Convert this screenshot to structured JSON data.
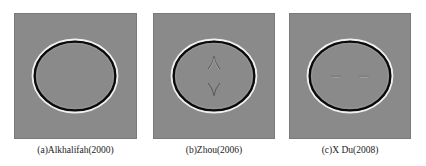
{
  "figure": {
    "panels": [
      {
        "id": "a",
        "caption": "(a)Alkhalifah(2000)",
        "artifact": "none"
      },
      {
        "id": "b",
        "caption": "(b)Zhou(2006)",
        "artifact": "diamond-shaped cusp artifacts (top and bottom) inside wavefront"
      },
      {
        "id": "c",
        "caption": "(c)X Du(2008)",
        "artifact": "weak horizontal streak artifacts inside wavefront"
      }
    ],
    "colors": {
      "background": "#8a8a8a",
      "wavefront_dark": "#0a0a0a",
      "wavefront_light": "#f2f2f2"
    }
  }
}
